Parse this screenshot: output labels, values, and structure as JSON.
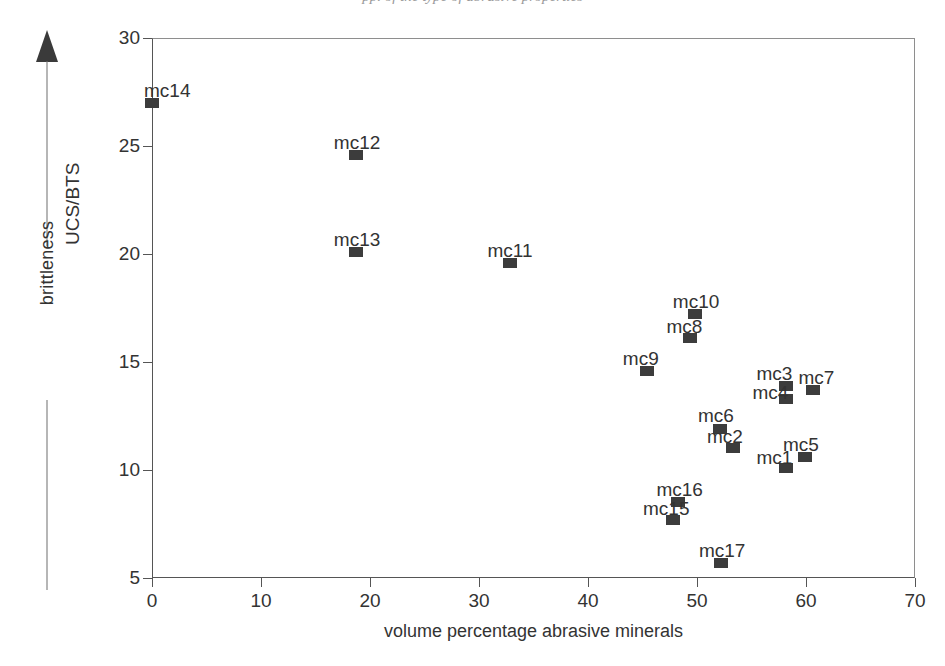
{
  "page": {
    "head_sliver_text": "pp. of the type of abrasive properties"
  },
  "chart_data": {
    "type": "scatter",
    "title": "",
    "xlabel": "volume percentage abrasive minerals",
    "ylabel": "UCS/BTS",
    "secondary_ylabel": "brittleness",
    "xlim": [
      0,
      70
    ],
    "ylim": [
      5,
      30
    ],
    "xticks": [
      0,
      10,
      20,
      30,
      40,
      50,
      60,
      70
    ],
    "yticks": [
      5,
      10,
      15,
      20,
      25,
      30
    ],
    "grid": false,
    "legend": null,
    "marker_color": "#3c3c3c",
    "marker_shape": "square",
    "points": [
      {
        "label": "mc14",
        "x": 0.0,
        "y": 27.0,
        "lx": -8,
        "ly": -22
      },
      {
        "label": "mc12",
        "x": 18.7,
        "y": 24.6,
        "lx": -22,
        "ly": -22
      },
      {
        "label": "mc13",
        "x": 18.7,
        "y": 20.1,
        "lx": -22,
        "ly": -22
      },
      {
        "label": "mc11",
        "x": 32.8,
        "y": 19.6,
        "lx": -22,
        "ly": -22
      },
      {
        "label": "mc10",
        "x": 49.8,
        "y": 17.2,
        "lx": -22,
        "ly": -22
      },
      {
        "label": "mc8",
        "x": 49.4,
        "y": 16.1,
        "lx": -24,
        "ly": -21
      },
      {
        "label": "mc9",
        "x": 45.4,
        "y": 14.6,
        "lx": -24,
        "ly": -22
      },
      {
        "label": "mc3",
        "x": 58.2,
        "y": 13.9,
        "lx": -30,
        "ly": -22
      },
      {
        "label": "mc7",
        "x": 60.6,
        "y": 13.7,
        "lx": -14,
        "ly": -22
      },
      {
        "label": "mc4",
        "x": 58.2,
        "y": 13.3,
        "lx": -34,
        "ly": -16
      },
      {
        "label": "mc6",
        "x": 52.1,
        "y": 11.9,
        "lx": -22,
        "ly": -23
      },
      {
        "label": "mc2",
        "x": 53.3,
        "y": 11.0,
        "lx": -26,
        "ly": -21
      },
      {
        "label": "mc5",
        "x": 59.9,
        "y": 10.6,
        "lx": -22,
        "ly": -22
      },
      {
        "label": "mc1",
        "x": 58.2,
        "y": 10.1,
        "lx": -30,
        "ly": -20
      },
      {
        "label": "mc16",
        "x": 48.3,
        "y": 8.5,
        "lx": -22,
        "ly": -22
      },
      {
        "label": "mc15",
        "x": 47.8,
        "y": 7.7,
        "lx": -30,
        "ly": -21
      },
      {
        "label": "mc17",
        "x": 52.2,
        "y": 5.7,
        "lx": -22,
        "ly": -22
      }
    ]
  }
}
